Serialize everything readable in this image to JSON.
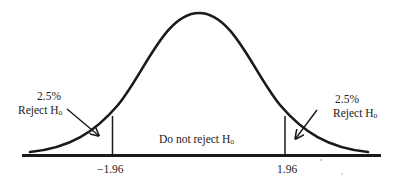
{
  "diagram": {
    "type": "normal-distribution-two-tailed-test",
    "colors": {
      "stroke": "#1a1a1a",
      "text": "#222222",
      "background": "#ffffff"
    },
    "left_tail": {
      "percent": "2.5%",
      "label": "Reject H",
      "subscript": "o"
    },
    "right_tail": {
      "percent": "2.5%",
      "label": "Reject H",
      "subscript": "o"
    },
    "center": {
      "label": "Do not reject H",
      "subscript": "o"
    },
    "critical_values": {
      "left": "−1.96",
      "right": "1.96"
    }
  }
}
